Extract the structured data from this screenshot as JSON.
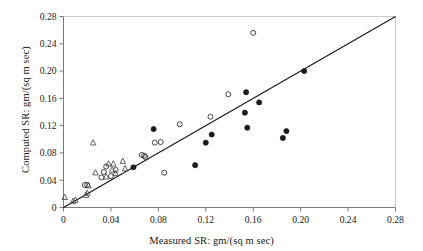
{
  "chart_data": {
    "type": "scatter",
    "title": "",
    "xlabel": "Measured SR: gm/(sq m sec)",
    "ylabel": "Computed SR: gm/(sq m sec)",
    "xlim": [
      0,
      0.28
    ],
    "ylim": [
      0,
      0.28
    ],
    "xticks": [
      0,
      0.04,
      0.08,
      0.12,
      0.16,
      0.2,
      0.24,
      0.28
    ],
    "yticks": [
      0,
      0.04,
      0.08,
      0.12,
      0.16,
      0.2,
      0.24,
      0.28
    ],
    "xtick_labels": [
      "0",
      "0.04",
      "0.08",
      "0.12",
      "0.16",
      "0.20",
      "0.24",
      "0.28"
    ],
    "ytick_labels": [
      "0",
      "0.04",
      "0.08",
      "0.12",
      "0.16",
      "0.20",
      "0.24",
      "0.28"
    ],
    "grid": false,
    "legend": "none",
    "reference_line": {
      "name": "one-to-one-line",
      "from": [
        0,
        0
      ],
      "to": [
        0.28,
        0.28
      ],
      "color": "#1a1a1a"
    },
    "series": [
      {
        "name": "open-triangle",
        "marker": "triangle-open",
        "color": "#555555",
        "points": [
          [
            0.001,
            0.015
          ],
          [
            0.008,
            0.009
          ],
          [
            0.01,
            0.011
          ],
          [
            0.019,
            0.018
          ],
          [
            0.02,
            0.021
          ],
          [
            0.021,
            0.032
          ],
          [
            0.025,
            0.095
          ],
          [
            0.027,
            0.051
          ],
          [
            0.036,
            0.045
          ],
          [
            0.038,
            0.064
          ],
          [
            0.041,
            0.055
          ],
          [
            0.042,
            0.064
          ],
          [
            0.044,
            0.05
          ],
          [
            0.05,
            0.068
          ],
          [
            0.052,
            0.057
          ]
        ]
      },
      {
        "name": "open-circle",
        "marker": "circle-open",
        "color": "#333333",
        "points": [
          [
            0.018,
            0.033
          ],
          [
            0.02,
            0.033
          ],
          [
            0.032,
            0.044
          ],
          [
            0.034,
            0.052
          ],
          [
            0.036,
            0.06
          ],
          [
            0.04,
            0.046
          ],
          [
            0.044,
            0.055
          ],
          [
            0.066,
            0.077
          ],
          [
            0.068,
            0.076
          ],
          [
            0.069,
            0.074
          ],
          [
            0.077,
            0.095
          ],
          [
            0.082,
            0.096
          ],
          [
            0.085,
            0.051
          ],
          [
            0.098,
            0.122
          ],
          [
            0.124,
            0.133
          ],
          [
            0.139,
            0.166
          ],
          [
            0.16,
            0.256
          ]
        ]
      },
      {
        "name": "filled-circle",
        "marker": "circle-filled",
        "color": "#1a1a1a",
        "points": [
          [
            0.059,
            0.059
          ],
          [
            0.076,
            0.115
          ],
          [
            0.111,
            0.062
          ],
          [
            0.12,
            0.095
          ],
          [
            0.125,
            0.107
          ],
          [
            0.153,
            0.139
          ],
          [
            0.154,
            0.169
          ],
          [
            0.155,
            0.117
          ],
          [
            0.165,
            0.154
          ],
          [
            0.185,
            0.102
          ],
          [
            0.188,
            0.112
          ],
          [
            0.203,
            0.2
          ]
        ]
      }
    ]
  },
  "axes": {
    "x_title": "Measured SR: gm/(sq m sec)",
    "y_title": "Computed SR: gm/(sq m sec)"
  }
}
